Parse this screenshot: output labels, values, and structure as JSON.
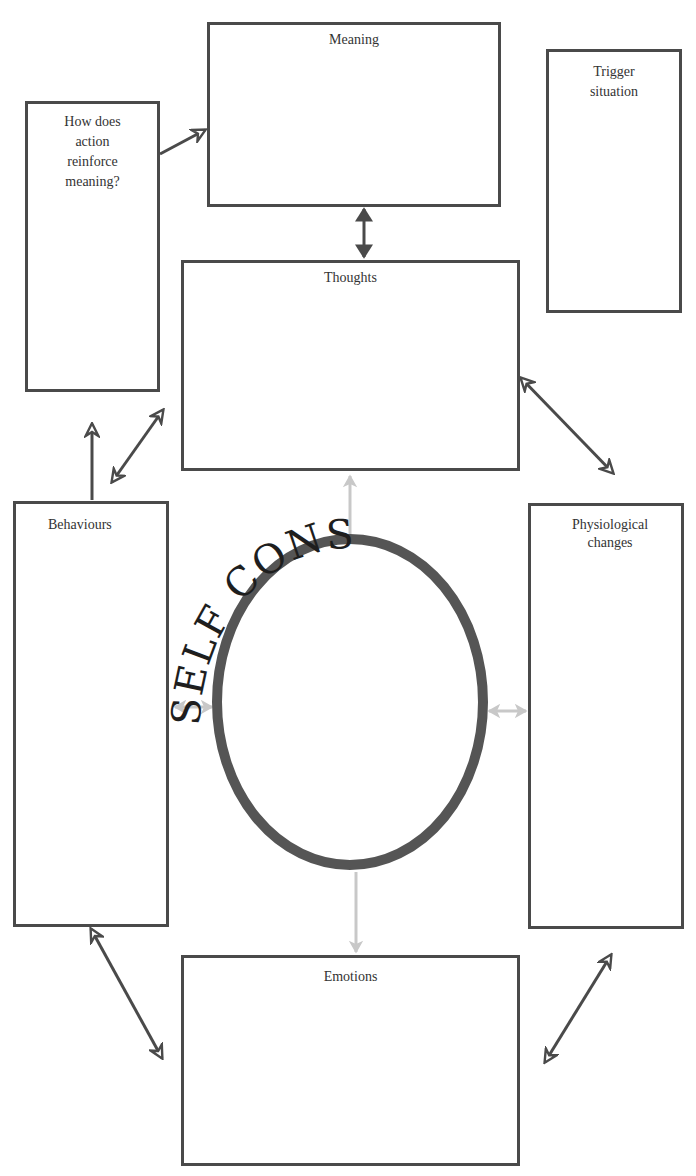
{
  "diagram": {
    "boxes": {
      "meaning": {
        "label": "Meaning"
      },
      "how_does": {
        "label": "How does action reinforce meaning?"
      },
      "trigger": {
        "label": "Trigger situation"
      },
      "thoughts": {
        "label": "Thoughts"
      },
      "behaviours": {
        "label": "Behaviours"
      },
      "physiological": {
        "label": "Physiological changes"
      },
      "emotions": {
        "label": "Emotions"
      }
    },
    "center": {
      "ring_text": "SELF CONSCIOUS ATTENTION FOCUSED ON ",
      "ring_color": "#555555",
      "light_arrow_color": "#c8c8c8"
    },
    "colors": {
      "border": "#4a4a4a",
      "arrow": "#4a4a4a",
      "text": "#333333"
    }
  }
}
